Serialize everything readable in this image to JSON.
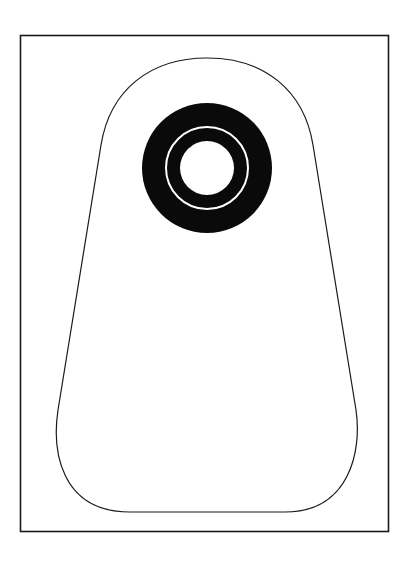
{
  "diagram": {
    "colors": {
      "background": "#ffffff",
      "line": "#1a1a1a",
      "fill": "#0a0a0a"
    },
    "frame": {
      "x": 20,
      "y": 35,
      "width": 369,
      "height": 497
    },
    "pouch": {
      "top_y": 58,
      "bottom_y": 512,
      "max_left_x": 56,
      "max_right_x": 358
    },
    "flange": {
      "cx": 207,
      "cy": 168,
      "outer_r": 65,
      "ring_r": 41,
      "hole_r": 27
    }
  }
}
